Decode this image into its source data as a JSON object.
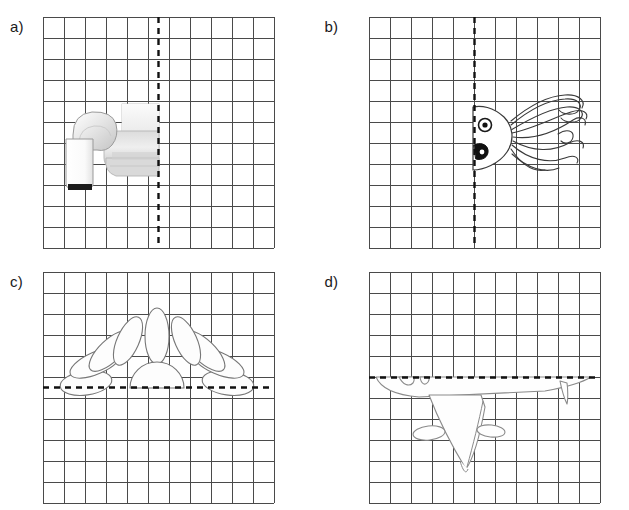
{
  "worksheet": {
    "title": "Symmetry worksheet - complete the other half",
    "grid": {
      "columns": 11,
      "rows": 11,
      "cell_size_px": 21,
      "line_color": "#4a4a4a",
      "line_width": 1,
      "background": "#ffffff"
    },
    "mirror_line": {
      "style": "dashed",
      "color": "#111111",
      "width": 2.4,
      "dash": "6 5"
    },
    "panels": [
      {
        "id": "a",
        "label": "a)",
        "subject": "sofa",
        "subject_icon": "sofa-icon",
        "mirror_axis": "vertical",
        "mirror_position_cells": 5.5,
        "drawn_half": "left",
        "shape_fill": "#e9e9e9",
        "shape_stroke": "#9a9a9a"
      },
      {
        "id": "b",
        "label": "b)",
        "subject": "squid",
        "subject_icon": "squid-icon",
        "mirror_axis": "vertical",
        "mirror_position_cells": 5.5,
        "drawn_half": "right",
        "shape_fill": "#ffffff",
        "shape_stroke": "#3a3a3a"
      },
      {
        "id": "c",
        "label": "c)",
        "subject": "flower",
        "subject_icon": "flower-icon",
        "mirror_axis": "horizontal",
        "mirror_position_cells": 5.5,
        "drawn_half": "top",
        "shape_fill": "#fdfdfd",
        "shape_stroke": "#777777"
      },
      {
        "id": "d",
        "label": "d)",
        "subject": "airplane",
        "subject_icon": "airplane-icon",
        "mirror_axis": "horizontal",
        "mirror_position_cells": 5.5,
        "drawn_half": "bottom",
        "shape_fill": "#fefefe",
        "shape_stroke": "#8a8a8a"
      }
    ]
  }
}
